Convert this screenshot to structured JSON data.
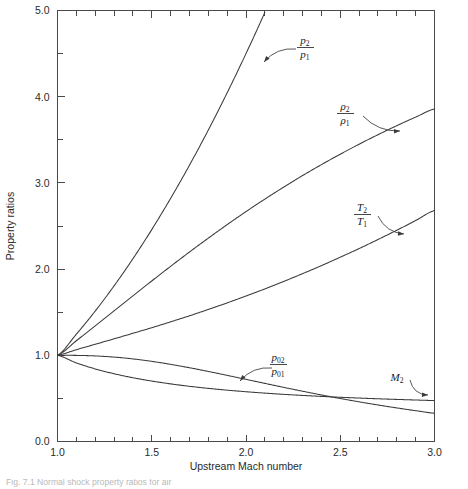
{
  "figure": {
    "caption_partial": "Fig. 7.1  Normal shock property ratios for air"
  },
  "chart_data": {
    "type": "line",
    "title": "",
    "xlabel": "Upstream Mach number",
    "ylabel": "Property ratios",
    "xlim": [
      1.0,
      3.0
    ],
    "ylim": [
      0.0,
      5.0
    ],
    "grid": false,
    "legend_position": "inline-annotations",
    "x_major_ticks": [
      1.0,
      1.5,
      2.0,
      2.5,
      3.0
    ],
    "x_major_tick_labels": [
      "1.0",
      "1.5",
      "2.0",
      "2.5",
      "3.0"
    ],
    "x_minor_tick_step": 0.1,
    "y_major_ticks": [
      0.0,
      1.0,
      2.0,
      3.0,
      4.0,
      5.0
    ],
    "y_major_tick_labels": [
      "0.0",
      "1.0",
      "2.0",
      "3.0",
      "4.0",
      "5.0"
    ],
    "y_minor_tick_step": 0.5,
    "x": [
      1.0,
      1.1,
      1.2,
      1.3,
      1.4,
      1.5,
      1.6,
      1.7,
      1.8,
      1.9,
      2.0,
      2.1,
      2.2,
      2.3,
      2.4,
      2.5,
      2.6,
      2.7,
      2.8,
      2.9,
      3.0
    ],
    "series": [
      {
        "name": "p2/p1",
        "label_numerator": "p",
        "label_numerator_sub": "2",
        "label_denominator": "p",
        "label_denominator_sub": "1",
        "clipped_at_top": true,
        "clip_x": 2.14,
        "values": [
          1.0,
          1.245,
          1.513,
          1.805,
          2.12,
          2.458,
          2.82,
          3.205,
          3.613,
          4.045,
          4.5,
          4.978,
          5.48,
          6.005,
          6.553,
          7.125,
          7.72,
          8.338,
          8.98,
          9.645,
          10.333
        ]
      },
      {
        "name": "rho2/rho1",
        "label_numerator": "ρ",
        "label_numerator_sub": "2",
        "label_denominator": "ρ",
        "label_denominator_sub": "1",
        "clipped_at_top": false,
        "values": [
          1.0,
          1.169,
          1.342,
          1.516,
          1.69,
          1.862,
          2.032,
          2.198,
          2.359,
          2.516,
          2.667,
          2.812,
          2.951,
          3.085,
          3.212,
          3.333,
          3.449,
          3.559,
          3.664,
          3.763,
          3.857
        ]
      },
      {
        "name": "T2/T1",
        "label_numerator": "T",
        "label_numerator_sub": "2",
        "label_denominator": "T",
        "label_denominator_sub": "1",
        "clipped_at_top": false,
        "values": [
          1.0,
          1.065,
          1.128,
          1.191,
          1.255,
          1.32,
          1.388,
          1.458,
          1.532,
          1.608,
          1.688,
          1.77,
          1.857,
          1.947,
          2.04,
          2.138,
          2.238,
          2.343,
          2.451,
          2.563,
          2.679
        ]
      },
      {
        "name": "p02/p01",
        "label_numerator": "p",
        "label_numerator_sub": "02",
        "label_denominator": "p",
        "label_denominator_sub": "01",
        "clipped_at_top": false,
        "values": [
          1.0,
          0.9989,
          0.9928,
          0.9794,
          0.9582,
          0.9298,
          0.8952,
          0.8557,
          0.8127,
          0.7674,
          0.7209,
          0.6742,
          0.6281,
          0.5833,
          0.5401,
          0.499,
          0.4601,
          0.4236,
          0.3895,
          0.3577,
          0.3283
        ]
      },
      {
        "name": "M2",
        "label_numerator": "M",
        "label_numerator_sub": "2",
        "label_denominator": "",
        "label_denominator_sub": "",
        "clipped_at_top": false,
        "values": [
          1.0,
          0.9118,
          0.8422,
          0.786,
          0.7397,
          0.7011,
          0.6684,
          0.6405,
          0.6165,
          0.5956,
          0.5774,
          0.5613,
          0.5471,
          0.5344,
          0.5231,
          0.513,
          0.5039,
          0.4956,
          0.4882,
          0.4814,
          0.4752
        ]
      }
    ],
    "annotations": [
      {
        "series": "p2/p1",
        "text": "p2/p1",
        "label_x": 305,
        "label_y": 44,
        "arrow_from_x": 296,
        "arrow_from_y": 49,
        "arrow_to_x": 264,
        "arrow_to_y": 62
      },
      {
        "series": "rho2/rho1",
        "text": "rho2/rho1",
        "label_x": 345,
        "label_y": 110,
        "arrow_from_x": 363,
        "arrow_from_y": 116,
        "arrow_to_x": 400,
        "arrow_to_y": 131
      },
      {
        "series": "T2/T1",
        "text": "T2/T1",
        "label_x": 362,
        "label_y": 211,
        "arrow_from_x": 378,
        "arrow_from_y": 216,
        "arrow_to_x": 404,
        "arrow_to_y": 234
      },
      {
        "series": "p02/p01",
        "text": "p02/p01",
        "label_x": 278,
        "label_y": 361,
        "arrow_from_x": 272,
        "arrow_from_y": 368,
        "arrow_to_x": 240,
        "arrow_to_y": 381
      },
      {
        "series": "M2",
        "text": "M2",
        "label_x": 397,
        "label_y": 377,
        "arrow_from_x": 410,
        "arrow_from_y": 380,
        "arrow_to_x": 428,
        "arrow_to_y": 395
      }
    ],
    "colors": {
      "curve": "#3a3a3a",
      "axis": "#4a4a4a",
      "text": "#2a2a2a",
      "background": "#ffffff"
    }
  }
}
